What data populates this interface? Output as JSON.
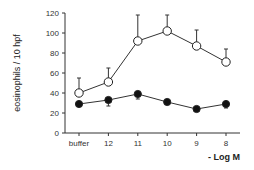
{
  "chart_data": {
    "type": "line",
    "title": "",
    "xlabel": "- Log M",
    "ylabel": "eosinophils / 10 hpf",
    "categories": [
      "buffer",
      "12",
      "11",
      "10",
      "9",
      "8"
    ],
    "ylim": [
      0,
      120
    ],
    "yticks": [
      0,
      20,
      40,
      60,
      80,
      100,
      120
    ],
    "grid": false,
    "legend": null,
    "series": [
      {
        "name": "open circles",
        "marker": "open-circle",
        "values": [
          40,
          51,
          92,
          102,
          87,
          71
        ],
        "error_upper": [
          55,
          65,
          118,
          118,
          103,
          84
        ]
      },
      {
        "name": "filled circles",
        "marker": "filled-circle",
        "values": [
          29,
          33,
          39,
          31,
          24,
          29
        ],
        "error_lower": [
          29,
          27,
          34,
          31,
          24,
          25
        ]
      }
    ]
  }
}
